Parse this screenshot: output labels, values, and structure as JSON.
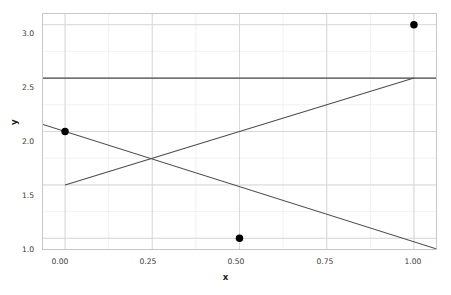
{
  "chart_data": {
    "type": "line",
    "title": "",
    "xlabel": "x",
    "ylabel": "y",
    "xlim": [
      -0.0632,
      1.0632
    ],
    "ylim": [
      0.9,
      3.1
    ],
    "grid": true,
    "minor_grid": true,
    "legend": "none",
    "background": "#ffffff",
    "xticks": [
      0.0,
      0.25,
      0.5,
      0.75,
      1.0
    ],
    "xticklabels": [
      "0.00",
      "0.25",
      "0.50",
      "0.75",
      "1.00"
    ],
    "yticks": [
      1.0,
      1.5,
      2.0,
      2.5,
      3.0
    ],
    "yticklabels": [
      "1.0",
      "1.5",
      "2.0",
      "2.5",
      "3.0"
    ],
    "x_minor_step": 0.125,
    "y_minor_step": 0.25,
    "grid_color": "#d5d5d5",
    "minor_grid_color": "#eaeaea",
    "frame_color": "#c8c8c8",
    "line_color": "#4d4d4d",
    "marker_color": "#000000",
    "marker_size": 7.5,
    "scatter": {
      "name": "data points",
      "x": [
        0.0,
        0.5,
        1.0
      ],
      "y": [
        2.0,
        1.0,
        3.0
      ]
    },
    "series": [
      {
        "name": "horizontal-mean-line",
        "kind": "line",
        "x": [
          -0.0632,
          1.0632
        ],
        "y": [
          2.5,
          2.5
        ]
      },
      {
        "name": "rising-line",
        "kind": "line",
        "x": [
          0.0,
          1.0
        ],
        "y": [
          1.5,
          2.5
        ]
      },
      {
        "name": "falling-line",
        "kind": "line",
        "x": [
          -0.0632,
          1.0632
        ],
        "y": [
          2.0658,
          0.9026
        ]
      }
    ]
  },
  "axes": {
    "ylabel_text": "y",
    "xlabel_text": "x",
    "ytick_0": "1.0",
    "ytick_1": "1.5",
    "ytick_2": "2.0",
    "ytick_3": "2.5",
    "ytick_4": "3.0",
    "xtick_0": "0.00",
    "xtick_1": "0.25",
    "xtick_2": "0.50",
    "xtick_3": "0.75",
    "xtick_4": "1.00"
  }
}
